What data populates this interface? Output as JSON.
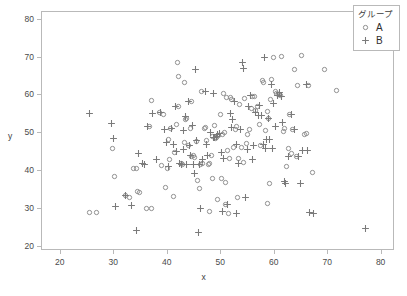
{
  "chart_data": {
    "type": "scatter",
    "title": "",
    "xlabel": "x",
    "ylabel": "y",
    "xlim": [
      16.5,
      82.5
    ],
    "ylim": [
      19.0,
      82.0
    ],
    "xticks": [
      20,
      30,
      40,
      50,
      60,
      70,
      80
    ],
    "yticks": [
      20,
      30,
      40,
      50,
      60,
      70,
      80
    ],
    "grid": false,
    "legend": {
      "title": "グループ",
      "position": "top-right",
      "entries": [
        {
          "name": "A",
          "marker": "circle-open",
          "color": "#8c8c8c"
        },
        {
          "name": "B",
          "marker": "plus",
          "color": "#7a7a7a"
        }
      ]
    },
    "series": [
      {
        "name": "A",
        "marker": "circle-open",
        "color": "#8c8c8c",
        "points": [
          [
            29.6,
            46.1
          ],
          [
            30.1,
            38.6
          ],
          [
            32.2,
            33.5
          ],
          [
            32.8,
            33.0
          ],
          [
            34.3,
            34.6
          ],
          [
            34.7,
            34.5
          ],
          [
            36.1,
            30.1
          ],
          [
            36.9,
            30.1
          ],
          [
            25.3,
            29.1
          ],
          [
            26.6,
            29.2
          ],
          [
            33.7,
            40.7
          ],
          [
            34.1,
            40.7
          ],
          [
            36.6,
            51.9
          ],
          [
            37.0,
            58.7
          ],
          [
            38.4,
            55.4
          ],
          [
            39.2,
            55.0
          ],
          [
            39.6,
            35.8
          ],
          [
            39.9,
            40.8
          ],
          [
            40.2,
            48.4
          ],
          [
            40.6,
            51.4
          ],
          [
            41.0,
            33.3
          ],
          [
            41.2,
            45.0
          ],
          [
            41.6,
            52.3
          ],
          [
            41.8,
            68.6
          ],
          [
            42.1,
            65.0
          ],
          [
            42.5,
            42.0
          ],
          [
            42.8,
            41.8
          ],
          [
            43.1,
            47.7
          ],
          [
            43.4,
            53.6
          ],
          [
            43.6,
            54.0
          ],
          [
            43.9,
            46.9
          ],
          [
            44.2,
            51.2
          ],
          [
            44.5,
            44.0
          ],
          [
            44.8,
            44.3
          ],
          [
            45.0,
            43.7
          ],
          [
            45.3,
            47.9
          ],
          [
            45.6,
            37.7
          ],
          [
            45.9,
            35.4
          ],
          [
            46.2,
            41.8
          ],
          [
            46.5,
            42.0
          ],
          [
            46.8,
            51.4
          ],
          [
            47.0,
            51.6
          ],
          [
            47.3,
            48.0
          ],
          [
            47.6,
            41.9
          ],
          [
            47.9,
            42.0
          ],
          [
            48.2,
            44.2
          ],
          [
            48.4,
            49.2
          ],
          [
            48.7,
            52.0
          ],
          [
            49.0,
            48.6
          ],
          [
            49.2,
            49.0
          ],
          [
            49.5,
            49.4
          ],
          [
            49.8,
            55.1
          ],
          [
            50.0,
            38.0
          ],
          [
            50.3,
            49.8
          ],
          [
            50.6,
            50.2
          ],
          [
            50.9,
            37.1
          ],
          [
            51.2,
            45.6
          ],
          [
            51.5,
            43.3
          ],
          [
            51.8,
            59.4
          ],
          [
            52.0,
            58.9
          ],
          [
            52.3,
            46.2
          ],
          [
            52.6,
            50.9
          ],
          [
            52.9,
            51.8
          ],
          [
            53.2,
            43.5
          ],
          [
            53.5,
            57.6
          ],
          [
            53.8,
            46.3
          ],
          [
            54.1,
            42.2
          ],
          [
            54.4,
            59.3
          ],
          [
            54.7,
            47.3
          ],
          [
            55.0,
            49.6
          ],
          [
            55.3,
            51.0
          ],
          [
            55.6,
            56.6
          ],
          [
            55.9,
            59.6
          ],
          [
            56.2,
            59.8
          ],
          [
            56.5,
            56.0
          ],
          [
            56.8,
            57.2
          ],
          [
            57.1,
            52.4
          ],
          [
            57.4,
            46.9
          ],
          [
            57.7,
            64.0
          ],
          [
            58.0,
            63.5
          ],
          [
            58.3,
            50.8
          ],
          [
            58.6,
            55.7
          ],
          [
            58.9,
            54.0
          ],
          [
            59.2,
            59.0
          ],
          [
            59.5,
            64.2
          ],
          [
            59.8,
            70.0
          ],
          [
            60.1,
            61.0
          ],
          [
            60.4,
            60.6
          ],
          [
            60.7,
            60.2
          ],
          [
            61.0,
            59.9
          ],
          [
            61.3,
            70.3
          ],
          [
            61.6,
            50.6
          ],
          [
            61.9,
            51.2
          ],
          [
            62.2,
            41.4
          ],
          [
            62.5,
            46.0
          ],
          [
            62.8,
            55.0
          ],
          [
            63.1,
            44.8
          ],
          [
            63.4,
            51.0
          ],
          [
            63.7,
            66.9
          ],
          [
            64.0,
            43.9
          ],
          [
            64.3,
            62.6
          ],
          [
            65.0,
            70.6
          ],
          [
            65.5,
            49.8
          ],
          [
            65.9,
            50.1
          ],
          [
            66.3,
            62.7
          ],
          [
            67.1,
            39.7
          ],
          [
            69.3,
            66.9
          ],
          [
            71.6,
            61.2
          ],
          [
            43.2,
            63.3
          ],
          [
            42.0,
            57.0
          ],
          [
            44.4,
            58.4
          ],
          [
            46.4,
            61.0
          ],
          [
            50.4,
            60.6
          ],
          [
            51.0,
            59.4
          ],
          [
            40.4,
            43.0
          ],
          [
            38.9,
            41.6
          ],
          [
            47.8,
            29.5
          ],
          [
            49.3,
            32.6
          ],
          [
            50.8,
            31.2
          ],
          [
            51.4,
            29.0
          ],
          [
            48.3,
            38.0
          ],
          [
            53.0,
            33.2
          ],
          [
            58.6,
            31.6
          ],
          [
            59.0,
            36.8
          ]
        ]
      },
      {
        "name": "B",
        "marker": "plus",
        "color": "#7a7a7a",
        "points": [
          [
            25.3,
            55.2
          ],
          [
            29.5,
            52.6
          ],
          [
            29.9,
            48.7
          ],
          [
            30.2,
            30.8
          ],
          [
            34.2,
            24.5
          ],
          [
            34.6,
            44.6
          ],
          [
            35.2,
            42.0
          ],
          [
            35.6,
            41.8
          ],
          [
            38.0,
            43.0
          ],
          [
            38.6,
            55.4
          ],
          [
            39.4,
            50.9
          ],
          [
            40.1,
            41.4
          ],
          [
            41.4,
            57.0
          ],
          [
            42.2,
            42.0
          ],
          [
            42.6,
            41.9
          ],
          [
            43.0,
            45.7
          ],
          [
            43.3,
            54.5
          ],
          [
            43.8,
            58.5
          ],
          [
            44.0,
            46.8
          ],
          [
            44.3,
            44.2
          ],
          [
            44.6,
            52.0
          ],
          [
            45.0,
            39.5
          ],
          [
            45.4,
            48.2
          ],
          [
            45.8,
            24.0
          ],
          [
            46.2,
            30.2
          ],
          [
            46.6,
            43.2
          ],
          [
            47.2,
            47.2
          ],
          [
            47.5,
            44.1
          ],
          [
            48.0,
            50.3
          ],
          [
            48.5,
            48.8
          ],
          [
            48.8,
            49.0
          ],
          [
            49.1,
            49.2
          ],
          [
            49.4,
            49.6
          ],
          [
            49.7,
            50.0
          ],
          [
            50.1,
            45.0
          ],
          [
            50.5,
            43.3
          ],
          [
            51.1,
            31.2
          ],
          [
            51.7,
            55.2
          ],
          [
            52.2,
            53.6
          ],
          [
            52.5,
            58.5
          ],
          [
            52.9,
            47.0
          ],
          [
            53.3,
            42.0
          ],
          [
            53.9,
            68.8
          ],
          [
            54.2,
            67.2
          ],
          [
            54.6,
            33.2
          ],
          [
            54.9,
            45.8
          ],
          [
            55.2,
            57.0
          ],
          [
            55.8,
            43.0
          ],
          [
            56.1,
            46.7
          ],
          [
            56.4,
            55.4
          ],
          [
            56.9,
            54.8
          ],
          [
            57.2,
            57.3
          ],
          [
            57.5,
            54.8
          ],
          [
            57.9,
            47.0
          ],
          [
            58.2,
            46.1
          ],
          [
            58.5,
            48.5
          ],
          [
            58.8,
            54.0
          ],
          [
            59.1,
            48.3
          ],
          [
            59.4,
            63.0
          ],
          [
            59.7,
            58.0
          ],
          [
            60.2,
            51.8
          ],
          [
            60.9,
            60.8
          ],
          [
            61.4,
            53.0
          ],
          [
            61.8,
            37.2
          ],
          [
            62.1,
            36.9
          ],
          [
            62.6,
            43.8
          ],
          [
            63.2,
            54.9
          ],
          [
            63.8,
            51.1
          ],
          [
            64.4,
            44.0
          ],
          [
            65.2,
            45.4
          ],
          [
            66.0,
            62.8
          ],
          [
            66.6,
            29.1
          ],
          [
            67.2,
            29.0
          ],
          [
            77.0,
            24.8
          ],
          [
            32.1,
            33.6
          ],
          [
            33.3,
            30.9
          ],
          [
            36.2,
            51.9
          ],
          [
            37.2,
            55.3
          ],
          [
            40.8,
            51.2
          ],
          [
            41.7,
            45.3
          ],
          [
            42.9,
            50.8
          ],
          [
            45.2,
            66.8
          ],
          [
            47.0,
            61.0
          ],
          [
            48.6,
            60.5
          ],
          [
            50.2,
            29.4
          ],
          [
            52.8,
            29.0
          ],
          [
            55.5,
            60.0
          ],
          [
            58.1,
            70.0
          ],
          [
            59.6,
            46.0
          ],
          [
            60.6,
            60.0
          ],
          [
            61.2,
            59.8
          ],
          [
            64.8,
            36.9
          ],
          [
            66.2,
            45.4
          ],
          [
            43.5,
            41.8
          ],
          [
            44.9,
            41.8
          ],
          [
            46.0,
            41.9
          ],
          [
            39.8,
            47.5
          ],
          [
            41.1,
            47.0
          ],
          [
            51.9,
            51.5
          ],
          [
            53.6,
            51.0
          ]
        ]
      }
    ]
  }
}
